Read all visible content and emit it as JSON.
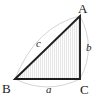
{
  "figure": {
    "kind": "geometry-diagram",
    "background_color": "#ffffff",
    "edge_color": "#1f1f1f",
    "arc_color": "#cfcfcf",
    "hatch_color": "#e2e2e2",
    "fill_color": "#fbfbfb",
    "label_color": "#1a1a1a",
    "vertices": [
      {
        "name": "A",
        "label": "A",
        "x": 80,
        "y": 16,
        "label_x": 78,
        "label_y": 2
      },
      {
        "name": "B",
        "label": "B",
        "x": 15,
        "y": 79,
        "label_x": 2,
        "label_y": 82
      },
      {
        "name": "C",
        "label": "C",
        "x": 80,
        "y": 79,
        "label_x": 80,
        "label_y": 83
      }
    ],
    "sides": [
      {
        "name": "a",
        "label": "a",
        "between": "B-C",
        "label_x": 46,
        "label_y": 84
      },
      {
        "name": "b",
        "label": "b",
        "between": "A-C",
        "label_x": 86,
        "label_y": 42
      },
      {
        "name": "c",
        "label": "c",
        "between": "B-A",
        "label_x": 36,
        "label_y": 38
      }
    ],
    "arcs": [
      {
        "name": "arc-a",
        "for_side": "a",
        "path": "M 15 79 Q 47 95 80 79"
      },
      {
        "name": "arc-b",
        "for_side": "b",
        "path": "M 80 16 Q 97 48 80 79"
      },
      {
        "name": "arc-c",
        "for_side": "c",
        "path": "M 15 79 Q 36 26 80 16"
      }
    ],
    "triangle_path": "M 15 79 L 80 16 L 80 79 Z"
  }
}
